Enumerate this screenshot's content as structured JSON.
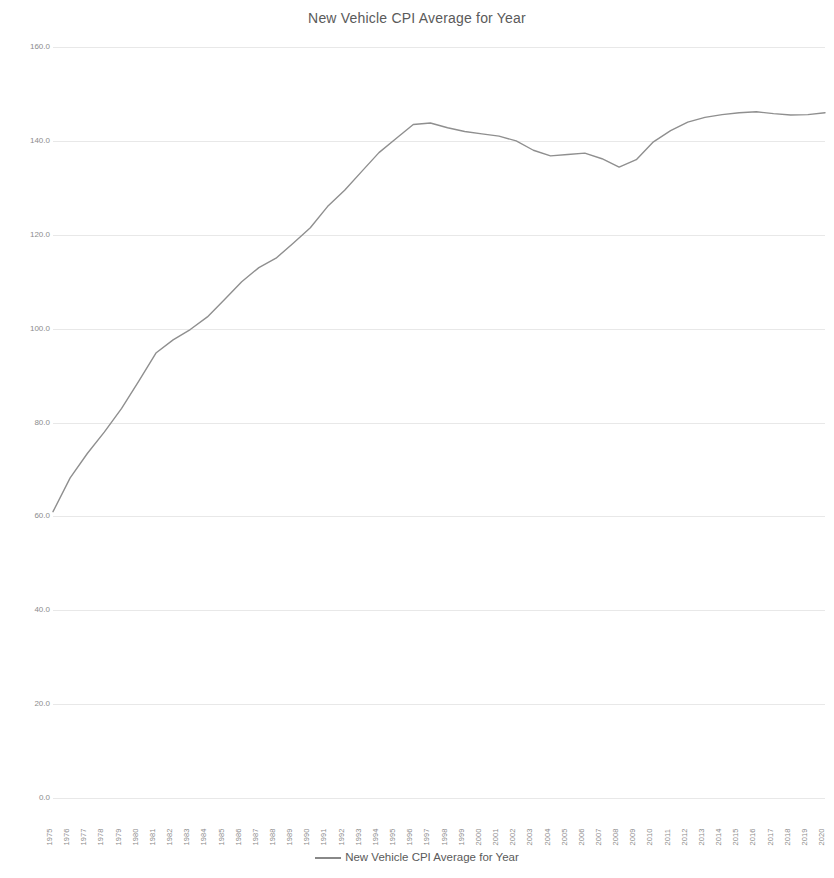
{
  "chart_data": {
    "type": "line",
    "title": "New Vehicle CPI Average for Year",
    "xlabel": "",
    "ylabel": "",
    "ylim": [
      0.0,
      160.0
    ],
    "y_ticks": [
      "0.0",
      "20.0",
      "40.0",
      "60.0",
      "80.0",
      "100.0",
      "120.0",
      "140.0",
      "160.0"
    ],
    "y_tick_values": [
      0,
      20,
      40,
      60,
      80,
      100,
      120,
      140,
      160
    ],
    "grid": true,
    "legend_position": "bottom",
    "line_color": "#8c8c8c",
    "series": [
      {
        "name": "New Vehicle CPI Average for Year",
        "values": [
          61.0,
          68.2,
          73.4,
          78.0,
          83.0,
          88.8,
          94.8,
          97.6,
          99.8,
          102.5,
          106.2,
          110.0,
          113.0,
          115.0,
          118.2,
          121.5,
          126.0,
          129.5,
          133.5,
          137.5,
          140.5,
          143.5,
          143.8,
          142.8,
          142.0,
          141.5,
          141.0,
          140.0,
          138.0,
          136.8,
          137.1,
          137.4,
          136.2,
          134.4,
          136.0,
          139.8,
          142.2,
          144.0,
          145.0,
          145.6,
          146.0,
          146.2,
          145.8,
          145.5,
          145.6,
          146.0
        ]
      }
    ],
    "categories": [
      "1975",
      "1976",
      "1977",
      "1978",
      "1979",
      "1980",
      "1981",
      "1982",
      "1983",
      "1984",
      "1985",
      "1986",
      "1987",
      "1988",
      "1989",
      "1990",
      "1991",
      "1992",
      "1993",
      "1994",
      "1995",
      "1996",
      "1997",
      "1998",
      "1999",
      "2000",
      "2001",
      "2002",
      "2003",
      "2004",
      "2005",
      "2006",
      "2007",
      "2008",
      "2009",
      "2010",
      "2011",
      "2012",
      "2013",
      "2014",
      "2015",
      "2016",
      "2017",
      "2018",
      "2019",
      "2020"
    ]
  },
  "legend": {
    "entries": [
      {
        "label": "New Vehicle CPI Average for Year",
        "color": "#888888"
      }
    ]
  }
}
